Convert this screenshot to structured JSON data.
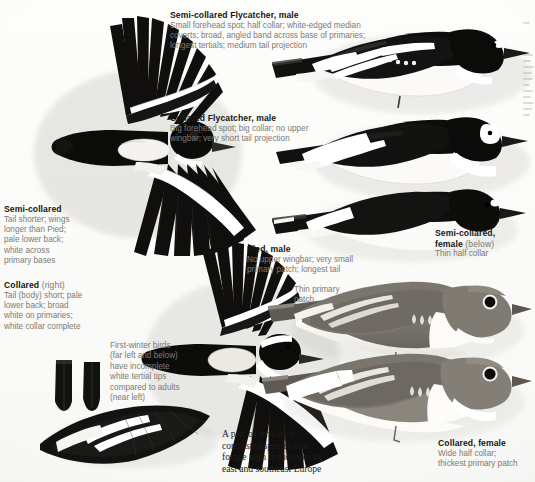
{
  "page": {
    "background_color": "#fdfdfb",
    "ink_color": "#161616",
    "caption_color": "#7c7a74"
  },
  "callouts": [
    {
      "id": "semi-collared-male",
      "heading": "Semi-collared Flycatcher, male",
      "heading_suffix": "",
      "lines": [
        "Small forehead spot; half collar; white-edged median",
        "coverts; broad, angled band across base of primaries;",
        "longest tertials; medium tail projection"
      ]
    },
    {
      "id": "collared-male",
      "heading": "Collared Flycatcher, male",
      "heading_suffix": "",
      "lines": [
        "Big forehead spot; big collar; no upper",
        "wingbar; very short tail projection"
      ]
    },
    {
      "id": "semi-collared-flight",
      "heading": "Semi-collared",
      "heading_suffix": "",
      "lines": [
        "Tail shorter; wings",
        "longer than Pied;",
        "pale lower back;",
        "white across",
        "primary bases"
      ]
    },
    {
      "id": "collared-flight",
      "heading": "Collared",
      "heading_suffix": "(right)",
      "lines": [
        "Tail (body) short; pale",
        "lower back; broad",
        "white on primaries;",
        "white collar complete"
      ]
    },
    {
      "id": "pied-male",
      "heading": "Pied, male",
      "heading_suffix": "",
      "lines": [
        "No upper wingbar; very small",
        "primary patch; longest tail"
      ]
    },
    {
      "id": "semi-collared-female",
      "heading": "Semi-collared,",
      "heading_line2": "female",
      "heading_suffix": "(below)",
      "lines": [
        "Thin half collar"
      ]
    },
    {
      "id": "collared-female",
      "heading": "Collared, female",
      "heading_suffix": "",
      "lines": [
        "Wide half collar;",
        "thickest primary patch"
      ]
    }
  ],
  "plain_labels": [
    {
      "id": "first-winter",
      "lines": [
        "First-winter birds",
        "(far left and below)",
        "have incomplete",
        "white tertial tips",
        "compared to adults",
        "(near left)"
      ]
    },
    {
      "id": "thin-primary-patch",
      "lines": [
        "Thin primary",
        "patch"
      ]
    }
  ],
  "note": {
    "id": "habitat-note",
    "lines": [
      "A pair of strikingly",
      "contrasted species that",
      "forage high in the trees in",
      "east and southeast Europe"
    ]
  },
  "figures": [
    {
      "id": "semi-collared-male-flight-upper",
      "label": "Semi-collared Flycatcher male in flight, upperside"
    },
    {
      "id": "semi-collared-male-perched",
      "label": "Semi-collared Flycatcher male perched"
    },
    {
      "id": "collared-male-perched",
      "label": "Collared Flycatcher male perched"
    },
    {
      "id": "pied-male-perched",
      "label": "Pied Flycatcher male perched"
    },
    {
      "id": "collared-male-flight-upper",
      "label": "Collared Flycatcher male in flight, upperside"
    },
    {
      "id": "tertial-first-winter",
      "label": "First-winter tertial feather"
    },
    {
      "id": "tertial-adult",
      "label": "Adult tertial feather"
    },
    {
      "id": "folded-wing",
      "label": "Folded wing showing tertial tips"
    },
    {
      "id": "semi-collared-female-perched",
      "label": "Semi-collared Flycatcher female perched"
    },
    {
      "id": "collared-female-perched",
      "label": "Collared Flycatcher female perched"
    }
  ]
}
